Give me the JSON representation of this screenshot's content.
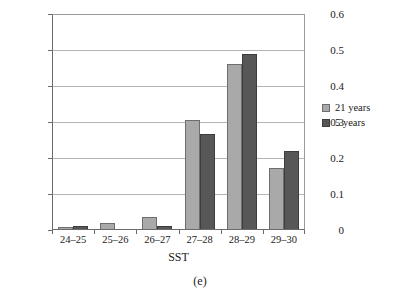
{
  "chart_data": {
    "type": "bar",
    "title": "",
    "xlabel": "SST",
    "ylabel": "",
    "categories": [
      "24–25",
      "25–26",
      "26–27",
      "27–28",
      "28–29",
      "29–30"
    ],
    "series": [
      {
        "name": "21 years",
        "color": "#a9a9a9",
        "values": [
          0.007,
          0.02,
          0.037,
          0.305,
          0.461,
          0.172
        ]
      },
      {
        "name": "5 years",
        "color": "#575757",
        "values": [
          0.01,
          0.0,
          0.011,
          0.268,
          0.489,
          0.22
        ]
      }
    ],
    "ylim": [
      0,
      0.6
    ],
    "yticks": [
      0,
      0.1,
      0.2,
      0.3,
      0.4,
      0.5,
      0.6
    ],
    "ytick_labels": [
      "0",
      "0.1",
      "0.2",
      "0.3",
      "0.4",
      "0.5",
      "0.6"
    ],
    "grid": "horizontal",
    "legend_position": "right"
  },
  "caption": "(e)"
}
